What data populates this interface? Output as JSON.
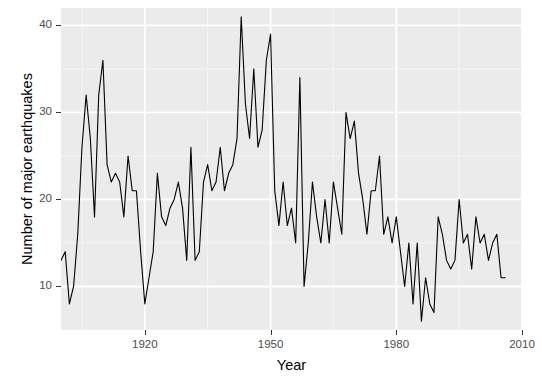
{
  "chart_data": {
    "type": "line",
    "title": "",
    "subtitle": "",
    "xlabel": "Year",
    "ylabel": "Number of major earthquakes",
    "xlim": [
      1900,
      2010
    ],
    "ylim": [
      5,
      42
    ],
    "xticks": [
      1920,
      1950,
      1980,
      2010
    ],
    "yticks": [
      10,
      20,
      30,
      40
    ],
    "xtick_labels": [
      "1920",
      "1950",
      "1980",
      "2010"
    ],
    "ytick_labels": [
      "10",
      "20",
      "30",
      "40"
    ],
    "grid": true,
    "grid_major_color": "#ffffff",
    "grid_minor_color": "#f5f5f5",
    "panel_background": "#ebebeb",
    "line_color": "#000000",
    "line_width": 1.1,
    "legend": "none",
    "x": [
      1900,
      1901,
      1902,
      1903,
      1904,
      1905,
      1906,
      1907,
      1908,
      1909,
      1910,
      1911,
      1912,
      1913,
      1914,
      1915,
      1916,
      1917,
      1918,
      1919,
      1920,
      1921,
      1922,
      1923,
      1924,
      1925,
      1926,
      1927,
      1928,
      1929,
      1930,
      1931,
      1932,
      1933,
      1934,
      1935,
      1936,
      1937,
      1938,
      1939,
      1940,
      1941,
      1942,
      1943,
      1944,
      1945,
      1946,
      1947,
      1948,
      1949,
      1950,
      1951,
      1952,
      1953,
      1954,
      1955,
      1956,
      1957,
      1958,
      1959,
      1960,
      1961,
      1962,
      1963,
      1964,
      1965,
      1966,
      1967,
      1968,
      1969,
      1970,
      1971,
      1972,
      1973,
      1974,
      1975,
      1976,
      1977,
      1978,
      1979,
      1980,
      1981,
      1982,
      1983,
      1984,
      1985,
      1986,
      1987,
      1988,
      1989,
      1990,
      1991,
      1992,
      1993,
      1994,
      1995,
      1996,
      1997,
      1998,
      1999,
      2000,
      2001,
      2002,
      2003,
      2004,
      2005,
      2006
    ],
    "values": [
      13,
      14,
      8,
      10,
      16,
      26,
      32,
      27,
      18,
      32,
      36,
      24,
      22,
      23,
      22,
      18,
      25,
      21,
      21,
      14,
      8,
      11,
      14,
      23,
      18,
      17,
      19,
      20,
      22,
      19,
      13,
      26,
      13,
      14,
      22,
      24,
      21,
      22,
      26,
      21,
      23,
      24,
      27,
      41,
      31,
      27,
      35,
      26,
      28,
      36,
      39,
      21,
      17,
      22,
      17,
      19,
      15,
      34,
      10,
      15,
      22,
      18,
      15,
      20,
      15,
      22,
      19,
      16,
      30,
      27,
      29,
      23,
      20,
      16,
      21,
      21,
      25,
      16,
      18,
      15,
      18,
      14,
      10,
      15,
      8,
      15,
      6,
      11,
      8,
      7,
      18,
      16,
      13,
      12,
      13,
      20,
      15,
      16,
      12,
      18,
      15,
      16,
      13,
      15,
      16,
      11,
      11
    ]
  },
  "axis": {
    "x_title": "Year",
    "y_title": "Number of major earthquakes"
  }
}
